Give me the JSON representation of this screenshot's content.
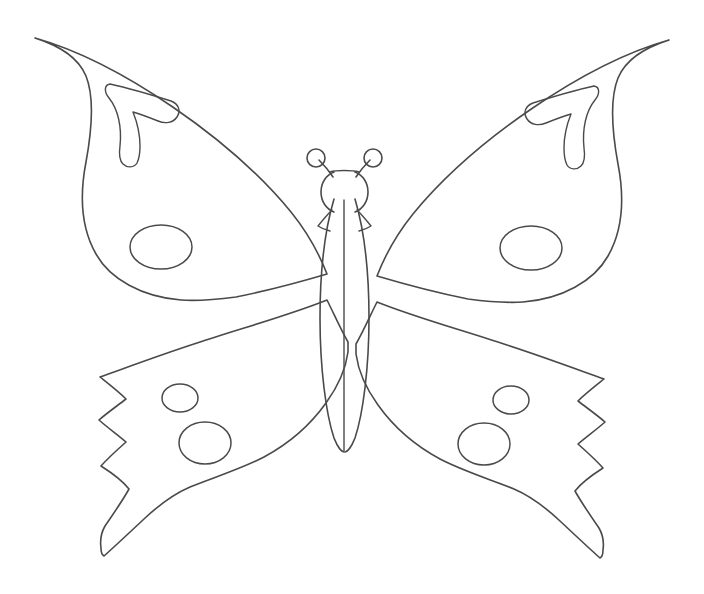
{
  "document": {
    "type": "line-art-coloring-page",
    "subject": "butterfly",
    "title": "Butterfly Outline Template",
    "background_color": "#ffffff",
    "stroke_color": "#4a4a4a",
    "fill_color": "none",
    "canvas": {
      "width": 704,
      "height": 594
    },
    "symmetry": "bilateral-vertical",
    "axis_x": 344
  },
  "figure": {
    "name": "butterfly",
    "parts": [
      {
        "id": "upper-left-wing",
        "label": "Upper Left Wing"
      },
      {
        "id": "upper-right-wing",
        "label": "Upper Right Wing"
      },
      {
        "id": "lower-left-wing",
        "label": "Lower Left Wing"
      },
      {
        "id": "lower-right-wing",
        "label": "Lower Right Wing"
      },
      {
        "id": "body",
        "label": "Body / Abdomen"
      },
      {
        "id": "head",
        "label": "Head"
      },
      {
        "id": "left-antenna",
        "label": "Left Antenna"
      },
      {
        "id": "right-antenna",
        "label": "Right Antenna"
      }
    ]
  },
  "shapes": {
    "upper_left_wing_outline": "M 35 38 C 120 62 232 140 291 212 C 308 233 320 256 327 274 C 300 282 266 291 236 297 C 213 300 196 301 181 300 C 142 297 110 279 96 254 C 80 226 80 193 86 162 C 93 124 94 96 86 76 C 78 57 60 46 35 38 Z",
    "upper_left_hook": "M 110 84 C 128 88 152 95 171 101 C 179 104 181 111 177 117 C 173 123 165 124 158 121 C 148 117 140 114 133 112 C 137 122 140 134 140 146 C 140 153 139 159 137 163 C 134 168 127 168 123 164 C 119 160 119 153 120 146 C 122 127 118 109 109 98 C 104 92 104 85 110 84 Z",
    "upper_right_wing_outline": "M 669 40 C 584 64 472 142 413 214 C 396 235 384 258 377 276 C 404 284 438 293 468 299 C 491 302 508 303 523 302 C 562 299 594 281 608 256 C 624 228 624 195 618 164 C 611 126 610 98 618 78 C 626 59 644 48 669 40 Z",
    "upper_right_hook": "M 594 86 C 576 90 552 97 533 103 C 525 106 523 113 527 119 C 531 125 539 126 546 123 C 556 119 564 116 571 114 C 567 124 564 136 564 148 C 564 155 565 161 567 165 C 570 170 577 170 581 166 C 585 162 585 155 584 148 C 582 129 586 111 595 100 C 600 94 600 87 594 86 Z",
    "lower_left_wing_outline": "M 327 300 C 290 315 239 329 197 343 C 160 355 128 367 100 377 C 110 385 119 392 126 399 C 117 406 107 413 99 420 C 108 428 118 435 126 442 C 117 450 108 458 101 466 C 112 473 122 480 129 489 C 123 500 114 513 105 526 C 101 533 100 541 101 548 C 101 552 102 555 104 556 C 113 548 128 534 144 519 C 161 503 176 493 190 487 C 212 478 241 469 264 457 C 290 443 311 424 326 403 C 339 385 346 367 348 352 C 348 348 348 345 348 342 C 341 330 334 314 327 300 Z",
    "lower_right_wing_outline": "M 377 302 C 414 317 465 331 507 345 C 544 357 576 369 604 379 C 594 387 585 394 578 401 C 587 408 597 415 605 422 C 596 430 586 437 578 444 C 587 452 596 460 603 468 C 592 475 582 482 575 491 C 581 502 590 515 599 528 C 603 535 604 543 603 550 C 603 554 602 557 600 558 C 591 550 576 536 560 521 C 543 505 528 495 514 489 C 492 480 463 471 440 459 C 414 445 393 426 378 405 C 365 387 358 369 356 354 C 356 350 356 347 356 344 C 363 332 370 316 377 302 Z",
    "body_left_edge": "M 334 199 C 326 226 320 268 320 318 C 320 368 326 414 334 438 C 338 448 342 452 344 452",
    "body_right_edge": "M 355 199 C 363 226 369 268 369 318 C 369 368 363 414 355 438 C 351 448 347 452 345 452",
    "body_center_line": "M 344 200 L 344 451",
    "head_left": "M 334 172 C 326 175 321 183 321 192 C 321 201 326 209 334 212",
    "head_right": "M 355 172 C 363 175 368 183 368 192 C 368 201 363 209 355 212",
    "head_top": "M 330 172 C 336 170 352 170 359 172",
    "left_antenna": "M 332 176 C 328 172 324 168 320 164 M 317 150 C 312 150 308 154 308 159 C 308 164 312 168 317 168 C 322 168 326 164 326 159 C 326 154 322 150 317 150 Z",
    "right_antenna": "M 357 176 C 361 172 365 168 369 164 M 372 150 C 377 150 381 154 381 159 C 381 164 377 168 372 168 C 367 168 363 164 363 159 C 363 154 367 150 372 150 Z",
    "antenna_left_stem": "M 333 177 C 329 171 324 165 319 160",
    "antenna_right_stem": "M 356 177 C 360 171 365 165 370 160",
    "thorax_left_flare": "M 332 210 C 327 215 322 221 318 226 C 321 228 326 230 330 231",
    "thorax_right_flare": "M 357 210 C 362 215 367 221 371 226 C 368 228 363 230 359 231"
  },
  "spots": [
    {
      "id": "upper-left-oval",
      "cx": 161,
      "cy": 247,
      "rx": 31,
      "ry": 22
    },
    {
      "id": "upper-right-oval",
      "cx": 531,
      "cy": 248,
      "rx": 31,
      "ry": 22
    },
    {
      "id": "lower-left-small-circle",
      "cx": 180,
      "cy": 398,
      "rx": 18,
      "ry": 14
    },
    {
      "id": "lower-left-large-circle",
      "cx": 205,
      "cy": 443,
      "rx": 26,
      "ry": 21
    },
    {
      "id": "lower-right-small-circle",
      "cx": 511,
      "cy": 400,
      "rx": 18,
      "ry": 14
    },
    {
      "id": "lower-right-large-circle",
      "cx": 484,
      "cy": 444,
      "rx": 26,
      "ry": 21
    }
  ],
  "chart_data": null
}
